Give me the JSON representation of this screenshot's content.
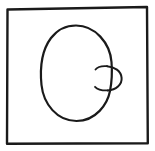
{
  "image": {
    "kind": "line-drawing",
    "subject": "face-profile-in-frame",
    "background_color": "#ffffff",
    "ink_color": "#1a1a1a",
    "width": 155,
    "height": 151,
    "caption": "",
    "text_content": ""
  },
  "frame": {
    "name": "rectangular-border",
    "stroke_color": "#1a1a1a",
    "stroke_width": 2.4,
    "left": 6,
    "top": 8,
    "right": 148,
    "bottom": 144,
    "tilt_note": "slightly tilted, right side a bit higher"
  },
  "figure": {
    "name": "head-profile",
    "head": {
      "name": "head-outline",
      "shape": "egg-oval",
      "center_x": 76,
      "center_y": 73,
      "radius_x": 35,
      "radius_y": 48,
      "top_y": 25,
      "bottom_y": 121,
      "left_x": 41,
      "right_x": 112,
      "stroke_width": 2.2
    },
    "nose": {
      "name": "nose-bump",
      "shape": "rounded-protrusion",
      "center_x": 110,
      "center_y": 78,
      "radius": 12,
      "tip_x": 121,
      "top_y": 66,
      "bottom_y": 90,
      "stroke_width": 2.0
    },
    "nose_bridge": {
      "name": "upper-nose-hook",
      "start_x": 96,
      "start_y": 68,
      "end_x": 107,
      "end_y": 66
    },
    "nostril_line": {
      "name": "lower-nose-hook",
      "start_x": 96,
      "start_y": 88,
      "end_x": 107,
      "end_y": 90
    }
  },
  "labels": {
    "frame": "picture frame border",
    "head": "head outline",
    "nose": "nose"
  }
}
